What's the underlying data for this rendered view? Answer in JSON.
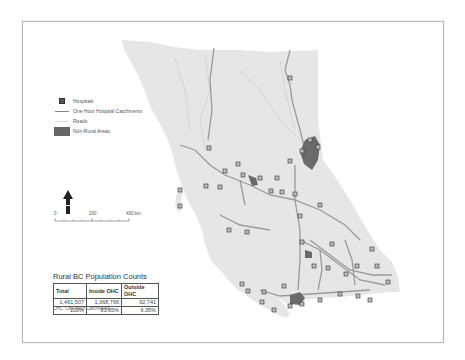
{
  "legend": {
    "items": [
      {
        "symbol": "hospital-square",
        "label": "Hospitals"
      },
      {
        "symbol": "line",
        "label": "One Hour Hospital Catchments"
      },
      {
        "symbol": "road-line",
        "label": "Roads"
      },
      {
        "symbol": "filled-area",
        "label": "Non-Rural Areas"
      }
    ]
  },
  "north_arrow": {
    "icon": "north-arrow-icon"
  },
  "scale_bar": {
    "labels": [
      "0",
      "200",
      "400 km"
    ]
  },
  "population_table": {
    "title": "Rural BC Population Counts",
    "headers": [
      "Total",
      "Inside OHC",
      "Outside OHC"
    ],
    "rows": [
      [
        "1,461,507",
        "1,368,766",
        "92,741"
      ],
      [
        "100%",
        "93.65%",
        "6.35%"
      ]
    ],
    "footnote": "OHC: One Hour Catchments"
  },
  "colors": {
    "land": "#e8e8e8",
    "catchment": "#9a9a9a",
    "non_rural": "#6a6a6a",
    "hospital": "#555555",
    "frame": "#b8b8b8"
  }
}
